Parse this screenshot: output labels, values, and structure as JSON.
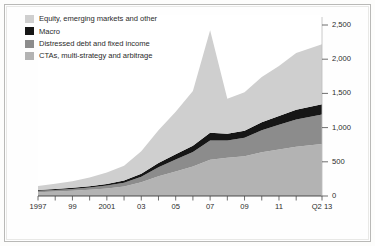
{
  "figure": {
    "background": "#fefefe",
    "frame_color": "#b9b9b7"
  },
  "legend": {
    "items": [
      {
        "label": "Equity, emerging markets and other",
        "color": "#cfcfcf",
        "name": "legend-item-equity"
      },
      {
        "label": "Macro",
        "color": "#161616",
        "name": "legend-item-macro"
      },
      {
        "label": "Distressed debt and fixed income",
        "color": "#8c8c8c",
        "name": "legend-item-distressed"
      },
      {
        "label": "CTAs, multi-strategy and arbitrage",
        "color": "#b3b3b3",
        "name": "legend-item-ctas"
      }
    ]
  },
  "chart_data": {
    "type": "area",
    "stacked": true,
    "title": "",
    "subtitle": "",
    "xlabel": "",
    "ylabel": "",
    "grid": false,
    "legend_position": "top-left",
    "xlim": [
      1997,
      2013.5
    ],
    "ylim": [
      0,
      2500
    ],
    "yticks": [
      0,
      500,
      1000,
      1500,
      2000,
      2500
    ],
    "ytick_labels": [
      "0",
      "500",
      "1,000",
      "1,500",
      "2,000",
      "2,500"
    ],
    "x": [
      1997,
      1998,
      1999,
      2000,
      2001,
      2002,
      2003,
      2004,
      2005,
      2006,
      2007,
      2008,
      2009,
      2010,
      2011,
      2012,
      2013.5
    ],
    "xticks": [
      1997,
      1998,
      1999,
      2000,
      2001,
      2002,
      2003,
      2004,
      2005,
      2006,
      2007,
      2008,
      2009,
      2010,
      2011,
      2012,
      2013.5
    ],
    "xtick_labels": [
      "1997",
      "",
      "99",
      "",
      "2001",
      "",
      "03",
      "",
      "05",
      "",
      "07",
      "",
      "09",
      "",
      "11",
      "",
      "Q2 13"
    ],
    "xtick_labels_shown": [
      {
        "value": 1997,
        "label": "1997"
      },
      {
        "value": 1999,
        "label": "99"
      },
      {
        "value": 2001,
        "label": "2001"
      },
      {
        "value": 2003,
        "label": "03"
      },
      {
        "value": 2005,
        "label": "05"
      },
      {
        "value": 2007,
        "label": "07"
      },
      {
        "value": 2009,
        "label": "09"
      },
      {
        "value": 2011,
        "label": "11"
      },
      {
        "value": 2013.5,
        "label": "Q2 13"
      }
    ],
    "stack_order_bottom_to_top": [
      "CTAs, multi-strategy and arbitrage",
      "Distressed debt and fixed income",
      "Macro",
      "Equity, emerging markets and other"
    ],
    "series": [
      {
        "name": "CTAs, multi-strategy and arbitrage",
        "color": "#b3b3b3",
        "values": [
          55,
          65,
          75,
          90,
          110,
          140,
          200,
          290,
          360,
          430,
          530,
          560,
          580,
          640,
          680,
          720,
          760
        ]
      },
      {
        "name": "Distressed debt and fixed income",
        "color": "#8c8c8c",
        "values": [
          20,
          24,
          28,
          34,
          42,
          55,
          80,
          130,
          175,
          215,
          280,
          250,
          270,
          320,
          360,
          400,
          430
        ]
      },
      {
        "name": "Macro",
        "color": "#161616",
        "values": [
          12,
          14,
          17,
          20,
          25,
          32,
          45,
          62,
          75,
          90,
          115,
          100,
          105,
          120,
          130,
          140,
          150
        ]
      },
      {
        "name": "Equity, emerging markets and other",
        "color": "#cfcfcf",
        "values": [
          60,
          75,
          95,
          125,
          165,
          215,
          330,
          480,
          620,
          800,
          1500,
          510,
          560,
          660,
          730,
          830,
          880
        ]
      }
    ],
    "totals": [
      147,
      178,
      215,
      269,
      342,
      442,
      655,
      962,
      1230,
      1535,
      2425,
      1420,
      1515,
      1740,
      1900,
      2090,
      2220
    ]
  }
}
